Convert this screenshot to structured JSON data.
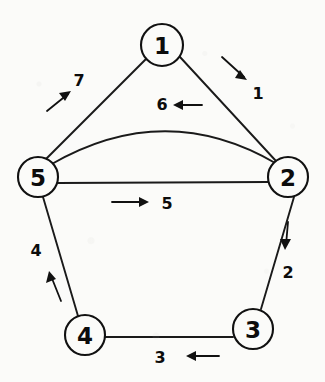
{
  "diagram": {
    "background_color": "#fbfbf9",
    "stroke_color": "#111111",
    "nodes": [
      {
        "id": "1",
        "label": "1",
        "cx": 162,
        "cy": 45,
        "r": 21
      },
      {
        "id": "2",
        "label": "2",
        "cx": 288,
        "cy": 177,
        "r": 20
      },
      {
        "id": "3",
        "label": "3",
        "cx": 253,
        "cy": 329,
        "r": 20
      },
      {
        "id": "4",
        "label": "4",
        "cx": 85,
        "cy": 335,
        "r": 20
      },
      {
        "id": "5",
        "label": "5",
        "cx": 38,
        "cy": 177,
        "r": 20
      }
    ],
    "edges": [
      {
        "id": "edge-1",
        "label": "1",
        "from": "1",
        "to": "2",
        "shape": "line",
        "label_x": 258,
        "label_y": 93,
        "arrow": {
          "x1": 222,
          "y1": 57,
          "x2": 247,
          "y2": 80
        }
      },
      {
        "id": "edge-2",
        "label": "2",
        "from": "2",
        "to": "3",
        "shape": "line",
        "label_x": 288,
        "label_y": 272,
        "arrow": {
          "x1": 288,
          "y1": 222,
          "x2": 285,
          "y2": 250
        }
      },
      {
        "id": "edge-3",
        "label": "3",
        "from": "3",
        "to": "4",
        "shape": "line",
        "label_x": 160,
        "label_y": 357,
        "arrow": {
          "x1": 219,
          "y1": 356,
          "x2": 186,
          "y2": 356
        }
      },
      {
        "id": "edge-4",
        "label": "4",
        "from": "4",
        "to": "5",
        "shape": "line",
        "label_x": 36,
        "label_y": 250,
        "arrow": {
          "x1": 61,
          "y1": 301,
          "x2": 49,
          "y2": 271
        }
      },
      {
        "id": "edge-5",
        "label": "5",
        "from": "5",
        "to": "2",
        "shape": "line",
        "label_x": 167,
        "label_y": 203,
        "arrow": {
          "x1": 112,
          "y1": 202,
          "x2": 149,
          "y2": 202
        }
      },
      {
        "id": "edge-6",
        "label": "6",
        "from": "2",
        "to": "5",
        "shape": "curve",
        "label_x": 162,
        "label_y": 104,
        "arrow": {
          "x1": 202,
          "y1": 105,
          "x2": 173,
          "y2": 105
        }
      },
      {
        "id": "edge-7",
        "label": "7",
        "from": "5",
        "to": "1",
        "shape": "line",
        "label_x": 79,
        "label_y": 80,
        "arrow": {
          "x1": 47,
          "y1": 111,
          "x2": 71,
          "y2": 91
        }
      }
    ]
  }
}
